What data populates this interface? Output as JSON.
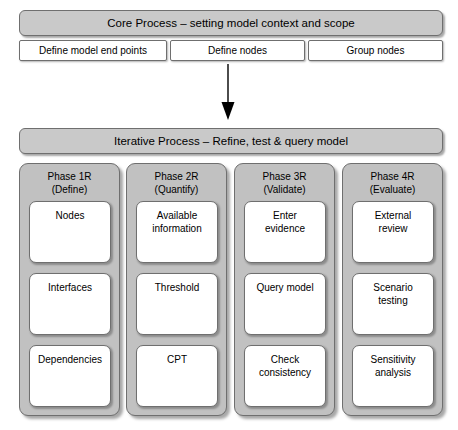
{
  "core_process": {
    "title": "Core Process – setting model context and scope",
    "steps": [
      {
        "label": "Define model end points"
      },
      {
        "label": "Define nodes"
      },
      {
        "label": "Group nodes"
      }
    ]
  },
  "flow": {
    "arrow": "down-arrow-icon"
  },
  "iterative_process": {
    "title": "Iterative Process  – Refine, test & query model",
    "phases": [
      {
        "title": "Phase 1R\n(Define)",
        "items": [
          {
            "label": "Nodes"
          },
          {
            "label": "Interfaces"
          },
          {
            "label": "Dependencies"
          }
        ]
      },
      {
        "title": "Phase 2R\n(Quantify)",
        "items": [
          {
            "label": "Available\ninformation"
          },
          {
            "label": "Threshold"
          },
          {
            "label": "CPT"
          }
        ]
      },
      {
        "title": "Phase 3R\n(Validate)",
        "items": [
          {
            "label": "Enter\nevidence"
          },
          {
            "label": "Query model"
          },
          {
            "label": "Check\nconsistency"
          }
        ]
      },
      {
        "title": "Phase 4R\n(Evaluate)",
        "items": [
          {
            "label": "External\nreview"
          },
          {
            "label": "Scenario\ntesting"
          },
          {
            "label": "Sensitivity\nanalysis"
          }
        ]
      }
    ]
  },
  "colors": {
    "header_fill": "#c9c9c9",
    "column_fill": "#c1c1c1",
    "box_fill": "#ffffff",
    "stroke": "#6f6f6f",
    "text": "#000000"
  }
}
